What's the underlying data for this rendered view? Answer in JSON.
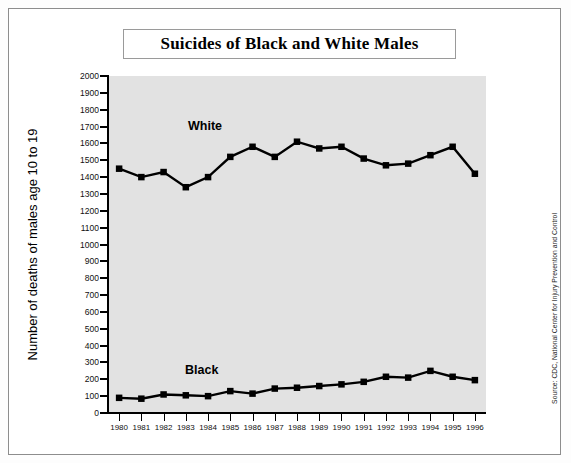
{
  "title": "Suicides of Black and White Males",
  "y_axis_title": "Number of deaths of males age 10 to 19",
  "source_note": "Source: CDC, National Center for Injury Prevention and Control",
  "series_labels": {
    "white": "White",
    "black": "Black"
  },
  "chart_data": {
    "type": "line",
    "title": "Suicides of Black and White Males",
    "xlabel": "",
    "ylabel": "Number of deaths of males age 10 to 19",
    "ylim": [
      0,
      2000
    ],
    "ytick_step": 100,
    "grid": false,
    "legend": "inline-labels",
    "categories": [
      "1980",
      "1981",
      "1982",
      "1983",
      "1984",
      "1985",
      "1986",
      "1987",
      "1988",
      "1989",
      "1990",
      "1991",
      "1992",
      "1993",
      "1994",
      "1995",
      "1996"
    ],
    "ytick_labels": [
      "2000",
      "1900",
      "1800",
      "1700",
      "1600",
      "1500",
      "1400",
      "1300",
      "1200",
      "1100",
      "1000",
      "900",
      "800",
      "700",
      "600",
      "500",
      "400",
      "300",
      "200",
      "100",
      "0"
    ],
    "series": [
      {
        "name": "White",
        "color": "#000000",
        "values": [
          1450,
          1400,
          1430,
          1340,
          1400,
          1520,
          1580,
          1520,
          1610,
          1570,
          1580,
          1510,
          1470,
          1480,
          1530,
          1580,
          1420
        ]
      },
      {
        "name": "Black",
        "color": "#000000",
        "values": [
          90,
          85,
          110,
          105,
          100,
          130,
          115,
          145,
          150,
          160,
          170,
          185,
          215,
          210,
          250,
          215,
          195
        ]
      }
    ]
  }
}
